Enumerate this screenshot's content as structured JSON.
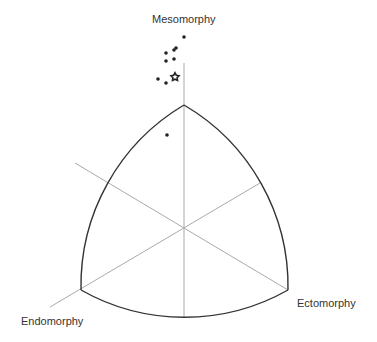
{
  "labels": {
    "top": "Mesomorphy",
    "left": "Endomorphy",
    "right": "Ectomorphy"
  },
  "colors": {
    "outline": "#333333",
    "axis": "#aaaaaa",
    "point": "#222222"
  },
  "points": [
    {
      "x": 184,
      "y": 37
    },
    {
      "x": 176,
      "y": 48
    },
    {
      "x": 174,
      "y": 50
    },
    {
      "x": 166,
      "y": 53
    },
    {
      "x": 166,
      "y": 61
    },
    {
      "x": 174,
      "y": 59
    },
    {
      "x": 158,
      "y": 79
    },
    {
      "x": 166,
      "y": 83
    },
    {
      "x": 167,
      "y": 135
    }
  ],
  "mean_marker": {
    "x": 175,
    "y": 77,
    "shape": "star"
  }
}
